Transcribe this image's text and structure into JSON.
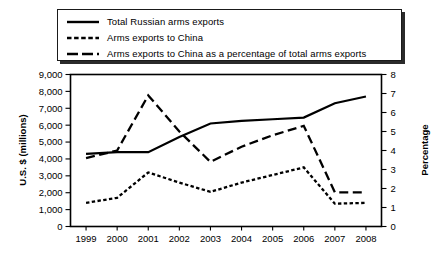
{
  "legend": {
    "items": [
      {
        "label": "Total Russian arms exports",
        "style": "solid",
        "icon": "solid-line-swatch"
      },
      {
        "label": "Arms exports to China",
        "style": "dotted",
        "icon": "dotted-line-swatch"
      },
      {
        "label": "Arms exports to China as a percentage of total arms exports",
        "style": "dashed",
        "icon": "dashed-line-swatch"
      }
    ]
  },
  "chart_data": {
    "type": "line",
    "title": "",
    "xlabel": "",
    "ylabel": "U.S. $ (millions)",
    "y2label": "Percentage",
    "categories": [
      "1999",
      "2000",
      "2001",
      "2002",
      "2003",
      "2004",
      "2005",
      "2006",
      "2007",
      "2008"
    ],
    "ylim": [
      0,
      9000
    ],
    "yticks": [
      "0",
      "1,000",
      "2,000",
      "3,000",
      "4,000",
      "5,000",
      "6,000",
      "7,000",
      "8,000",
      "9,000"
    ],
    "ytickvalues": [
      0,
      1000,
      2000,
      3000,
      4000,
      5000,
      6000,
      7000,
      8000,
      9000
    ],
    "y2lim": [
      0,
      8
    ],
    "y2ticks": [
      "0",
      "1",
      "2",
      "3",
      "4",
      "5",
      "6",
      "7",
      "8"
    ],
    "y2tickvalues": [
      0,
      1,
      2,
      3,
      4,
      5,
      6,
      7,
      8
    ],
    "grid": false,
    "legend_position": "top",
    "series": [
      {
        "name": "Total Russian arms exports",
        "style": "solid",
        "axis": "left",
        "unit": "U.S. $ (millions)",
        "values": [
          4300,
          4400,
          4400,
          5300,
          6100,
          6250,
          6350,
          6450,
          7300,
          7700
        ]
      },
      {
        "name": "Arms exports to China",
        "style": "dotted",
        "axis": "left",
        "unit": "U.S. $ (millions)",
        "values": [
          1400,
          1700,
          3200,
          2600,
          2050,
          2600,
          3050,
          3500,
          1350,
          1400
        ]
      },
      {
        "name": "Arms exports to China as a percentage of total arms exports",
        "style": "dashed",
        "axis": "right",
        "unit": "Percentage",
        "values": [
          3.6,
          4.0,
          6.9,
          5.0,
          3.4,
          4.2,
          4.8,
          5.3,
          1.8,
          1.8
        ]
      }
    ]
  }
}
